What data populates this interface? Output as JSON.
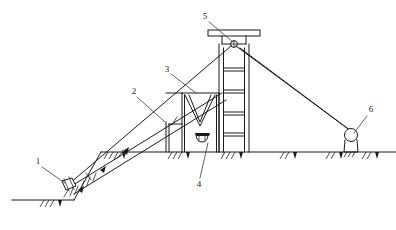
{
  "figure": {
    "type": "engineering-line-diagram",
    "style": "monochrome line drawing, black on white",
    "canvas": {
      "width": 396,
      "height": 230
    }
  },
  "ground": {
    "main_line_label": "ground level line",
    "main_line": {
      "x1": 101,
      "y1": 152,
      "x2": 396,
      "y2": 152
    },
    "lower_line": {
      "x1": 12,
      "y1": 200,
      "x2": 75,
      "y2": 200
    },
    "hatch_count_main": 11,
    "hatch_count_lower": 2
  },
  "callouts": [
    {
      "id": "1",
      "number": "1",
      "name": "ground-anchor-block",
      "description": "Lower anchor block with rope lashing at foot of incline",
      "label_x": 38,
      "label_y": 162,
      "leader": {
        "x1": 42,
        "y1": 168,
        "x2": 66,
        "y2": 186
      }
    },
    {
      "id": "2",
      "number": "2",
      "name": "inclined-ramp-beam",
      "description": "Inclined ramp / conveyor beam with vertical support post",
      "label_x": 134,
      "label_y": 92,
      "leader": {
        "x1": 138,
        "y1": 97,
        "x2": 166,
        "y2": 123
      }
    },
    {
      "id": "3",
      "number": "3",
      "name": "v-hopper-chute",
      "description": "V-shaped hopper / receiving chute",
      "label_x": 167,
      "label_y": 70,
      "leader": {
        "x1": 172,
        "y1": 74,
        "x2": 196,
        "y2": 92
      }
    },
    {
      "id": "4",
      "number": "4",
      "name": "discharge-trough",
      "description": "Curved discharge trough beneath hopper",
      "label_x": 199,
      "label_y": 185,
      "leader": {
        "x1": 200,
        "y1": 179,
        "x2": 209,
        "y2": 142
      }
    },
    {
      "id": "5",
      "number": "5",
      "name": "head-sheave-wheel",
      "description": "Head sheave wheel under the cap platform",
      "label_x": 205,
      "label_y": 17,
      "leader": {
        "x1": 209,
        "y1": 21,
        "x2": 234,
        "y2": 43
      }
    },
    {
      "id": "6",
      "number": "6",
      "name": "deflection-roller",
      "description": "Deflection roller on right-hand ground bearing",
      "label_x": 370,
      "label_y": 110,
      "leader": {
        "x1": 367,
        "y1": 115,
        "x2": 355,
        "y2": 135
      }
    }
  ],
  "components": {
    "tower": {
      "name": "headframe-tower",
      "left_post_x": 219,
      "right_post_x": 248,
      "top_y": 44,
      "bottom_y": 152,
      "rung_ys": [
        68,
        90,
        112,
        133
      ],
      "inner_left_x": 224,
      "inner_right_x": 243
    },
    "cap": {
      "name": "tower-cap-platform",
      "x": 208,
      "y": 30,
      "width": 52,
      "height": 6,
      "neck_left_x": 222,
      "neck_right_x": 246,
      "neck_bottom_y": 44
    },
    "sheave": {
      "name": "sheave-wheel",
      "cx": 234,
      "cy": 44,
      "r": 3.2
    },
    "incline": {
      "name": "inclined-ramp",
      "upper": {
        "x1": 68,
        "y1": 190,
        "x2": 222,
        "y2": 95
      },
      "lower": {
        "x1": 72,
        "y1": 196,
        "x2": 226,
        "y2": 101
      },
      "support_post_x": 166,
      "support_post_top_y": 122,
      "support_post_bottom_y": 152
    },
    "hopper": {
      "name": "v-hopper",
      "left_top_x": 182,
      "right_top_x": 219,
      "top_y": 93,
      "apex_x": 200,
      "apex_y": 128
    },
    "trough": {
      "name": "discharge-trough",
      "cx": 206,
      "cy": 138,
      "width": 20,
      "height": 7
    },
    "right_cables": {
      "name": "right-stay-cables",
      "upper": {
        "x1": 236,
        "y1": 46,
        "x2": 352,
        "y2": 134
      },
      "lower": {
        "x1": 240,
        "y1": 47,
        "x2": 356,
        "y2": 136
      }
    },
    "left_cable": {
      "name": "left-stay-cable",
      "line": {
        "x1": 232,
        "y1": 46,
        "x2": 70,
        "y2": 186
      }
    },
    "roller": {
      "name": "deflection-roller",
      "cx": 351,
      "cy": 136,
      "r": 6.5,
      "base_x": 344,
      "base_y": 152,
      "base_width": 14
    },
    "anchor_block": {
      "name": "anchor-block",
      "cx": 68,
      "cy": 186,
      "width": 13,
      "height": 9
    },
    "bays": {
      "name": "ground-level-bays",
      "verticals_x": [
        166,
        182,
        219
      ],
      "top_y": 93,
      "bottom_y": 152
    }
  }
}
